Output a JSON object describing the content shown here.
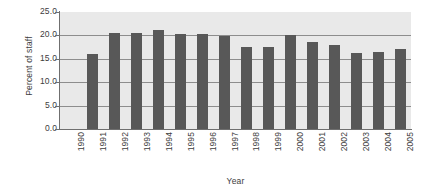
{
  "chart_data": {
    "type": "bar",
    "title": "",
    "xlabel": "Year",
    "ylabel": "Percent of staff",
    "categories": [
      "1990",
      "1991",
      "1992",
      "1993",
      "1994",
      "1995",
      "1996",
      "1997",
      "1998",
      "1999",
      "2000",
      "2001",
      "2002",
      "2003",
      "2004",
      "2005"
    ],
    "values": [
      null,
      16.1,
      20.6,
      20.6,
      21.2,
      20.2,
      20.2,
      19.8,
      17.5,
      17.5,
      20.0,
      18.5,
      18.0,
      16.3,
      16.5,
      17.1
    ],
    "ytick_labels": [
      "25.0",
      "20.0",
      "15.0",
      "10.0",
      "5.0",
      "0.0"
    ],
    "ytick_values": [
      25.0,
      20.0,
      15.0,
      10.0,
      5.0,
      0.0
    ],
    "ylim": [
      0.0,
      25.0
    ],
    "grid": true,
    "grid_axis": "y",
    "legend": false,
    "legend_position": "none",
    "bar_color": "#585858",
    "plot_background": "#e9e9e9",
    "gridline_color": "#8d8d8d",
    "axis_color": "#6f6f6f",
    "note": "1990 has no bar plotted"
  }
}
